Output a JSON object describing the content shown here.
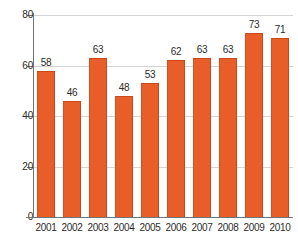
{
  "chart_data": {
    "type": "bar",
    "title": "",
    "subtitle": "",
    "xlabel": "",
    "ylabel": "",
    "categories": [
      "2001",
      "2002",
      "2003",
      "2004",
      "2005",
      "2006",
      "2007",
      "2008",
      "2009",
      "2010"
    ],
    "values": [
      58,
      46,
      63,
      48,
      53,
      62,
      63,
      63,
      73,
      71
    ],
    "data_labels": [
      "58",
      "46",
      "63",
      "48",
      "53",
      "62",
      "63",
      "63",
      "73",
      "71"
    ],
    "ylim": [
      0,
      80
    ],
    "ytick_labels": [
      "80",
      "60",
      "40",
      "20",
      "0"
    ],
    "ytick_values": [
      80,
      60,
      40,
      20,
      0
    ],
    "grid": true,
    "legend": null,
    "legend_position": "none",
    "series": [
      {
        "name": "",
        "values": [
          58,
          46,
          63,
          48,
          53,
          62,
          63,
          63,
          73,
          71
        ]
      }
    ],
    "colors": {
      "bar_fill": "#e85d28",
      "bar_edge": "#c9491c",
      "gridline": "#d2d4d6",
      "axis_line": "#6e7478",
      "text": "#2b2b2b",
      "background": "#ffffff"
    }
  }
}
